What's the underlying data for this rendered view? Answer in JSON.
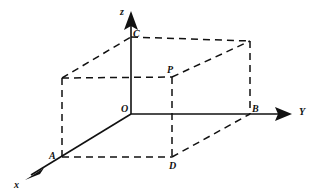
{
  "figure": {
    "name": "rectangular-box-3d-axes",
    "background_color": "#ffffff",
    "stroke_color": "#111111",
    "width": 319,
    "height": 195
  },
  "axes": [
    {
      "id": "x",
      "label": "x",
      "label_x": 14,
      "label_y": 180,
      "from": [
        131,
        114
      ],
      "to": [
        25,
        179
      ],
      "style": "solid"
    },
    {
      "id": "y",
      "label": "Y",
      "label_x": 299,
      "label_y": 108,
      "from": [
        131,
        114
      ],
      "to": [
        291,
        114
      ],
      "style": "solid"
    },
    {
      "id": "z",
      "label": "z",
      "label_x": 120,
      "label_y": 7,
      "from": [
        131,
        114
      ],
      "to": [
        131,
        13
      ],
      "style": "solid"
    }
  ],
  "points": [
    {
      "id": "O",
      "label": "O",
      "x": 131,
      "y": 114,
      "label_x": 121,
      "label_y": 104
    },
    {
      "id": "C",
      "label": "C",
      "x": 131,
      "y": 37,
      "label_x": 133,
      "label_y": 28
    },
    {
      "id": "B",
      "label": "B",
      "x": 250,
      "y": 114,
      "label_x": 252,
      "label_y": 104
    },
    {
      "id": "A",
      "label": "A",
      "x": 62,
      "y": 157,
      "label_x": 49,
      "label_y": 152
    },
    {
      "id": "D",
      "label": "D",
      "x": 172,
      "y": 157,
      "label_x": 169,
      "label_y": 161
    },
    {
      "id": "P",
      "label": "P",
      "x": 172,
      "y": 77,
      "label_x": 167,
      "label_y": 65
    }
  ],
  "edges": [
    {
      "id": "back-top-left-to-C",
      "from": [
        62,
        78
      ],
      "to": [
        131,
        37
      ],
      "style": "dashed"
    },
    {
      "id": "C-to-back-top-right",
      "from": [
        131,
        37
      ],
      "to": [
        250,
        41
      ],
      "style": "dashed"
    },
    {
      "id": "back-top-left-to-P",
      "from": [
        62,
        78
      ],
      "to": [
        172,
        77
      ],
      "style": "dashed"
    },
    {
      "id": "P-to-back-top-right",
      "from": [
        172,
        77
      ],
      "to": [
        250,
        41
      ],
      "style": "dashed"
    },
    {
      "id": "back-top-left-to-A",
      "from": [
        62,
        78
      ],
      "to": [
        62,
        157
      ],
      "style": "dashed"
    },
    {
      "id": "back-top-right-to-B",
      "from": [
        250,
        41
      ],
      "to": [
        250,
        114
      ],
      "style": "dashed"
    },
    {
      "id": "P-to-D",
      "from": [
        172,
        77
      ],
      "to": [
        172,
        157
      ],
      "style": "dashed"
    },
    {
      "id": "A-to-D",
      "from": [
        62,
        157
      ],
      "to": [
        172,
        157
      ],
      "style": "dashed"
    },
    {
      "id": "D-to-B",
      "from": [
        172,
        157
      ],
      "to": [
        250,
        114
      ],
      "style": "dashed"
    }
  ],
  "arrowheads": [
    {
      "id": "x-arrow",
      "points": "25,179 40,167 35,176 39,173"
    },
    {
      "id": "y-arrow",
      "points": "291,114 276,108 279,114 276,120"
    },
    {
      "id": "z-arrow",
      "points": "131,13 125,28 131,25 137,28"
    }
  ]
}
